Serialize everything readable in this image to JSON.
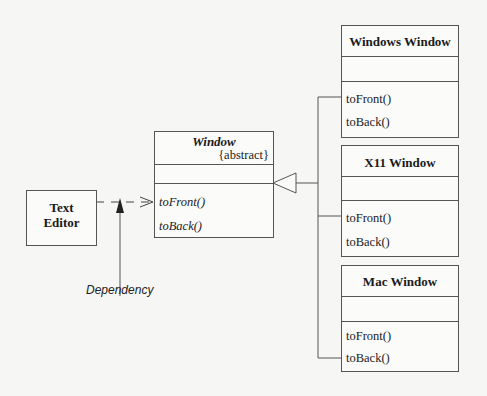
{
  "diagram": {
    "type": "UML class diagram",
    "client": {
      "name_line1": "Text",
      "name_line2": "Editor"
    },
    "abstract_class": {
      "name": "Window",
      "stereotype": "{abstract}",
      "operations": [
        "toFront()",
        "toBack()"
      ]
    },
    "subclasses": [
      {
        "name": "Windows Window",
        "operations": [
          "toFront()",
          "toBack()"
        ]
      },
      {
        "name": "X11 Window",
        "operations": [
          "toFront()",
          "toBack()"
        ]
      },
      {
        "name": "Mac Window",
        "operations": [
          "toFront()",
          "toBack()"
        ]
      }
    ],
    "annotations": {
      "dependency_label": "Dependency"
    },
    "relationships": [
      {
        "from": "Text Editor",
        "to": "Window",
        "kind": "dependency (dashed, open arrow)"
      },
      {
        "from": "Windows Window",
        "to": "Window",
        "kind": "generalization"
      },
      {
        "from": "X11 Window",
        "to": "Window",
        "kind": "generalization"
      },
      {
        "from": "Mac Window",
        "to": "Window",
        "kind": "generalization"
      }
    ],
    "colors": {
      "line": "#555555",
      "background": "#f6f6f4"
    }
  }
}
